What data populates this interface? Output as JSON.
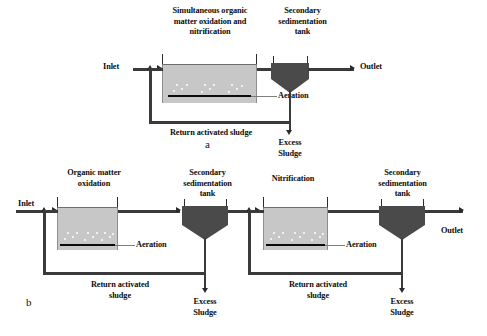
{
  "figure": {
    "caption_a": "a",
    "caption_b": "b",
    "colors": {
      "aeration_tank_fill": "#c7c7c7",
      "clarifier_fill": "#4a4a4a",
      "pipe": "#3a3a3a",
      "aeration_bar": "#0a0a0a",
      "background": "#ffffff"
    }
  },
  "diagram_a": {
    "title_reactor": "Simultaneous organic\nmatter oxidation and\nnitrification",
    "title_clarifier": "Secondary\nsedimentation\ntank",
    "inlet": "Inlet",
    "outlet": "Outlet",
    "aeration": "Aeration",
    "return_sludge": "Return activated sludge",
    "excess_sludge": "Excess\nSludge"
  },
  "diagram_b": {
    "stage1": {
      "title_reactor": "Organic matter\noxidation",
      "title_clarifier": "Secondary\nsedimentation\ntank",
      "inlet": "Inlet",
      "aeration": "Aeration",
      "return_sludge": "Return activated\nsludge",
      "excess_sludge": "Excess\nSludge"
    },
    "stage2": {
      "title_reactor": "Nitrification",
      "title_clarifier": "Secondary\nsedimentation\ntank",
      "outlet": "Outlet",
      "aeration": "Aeration",
      "return_sludge": "Return activated\nsludge",
      "excess_sludge": "Excess\nSludge"
    }
  }
}
